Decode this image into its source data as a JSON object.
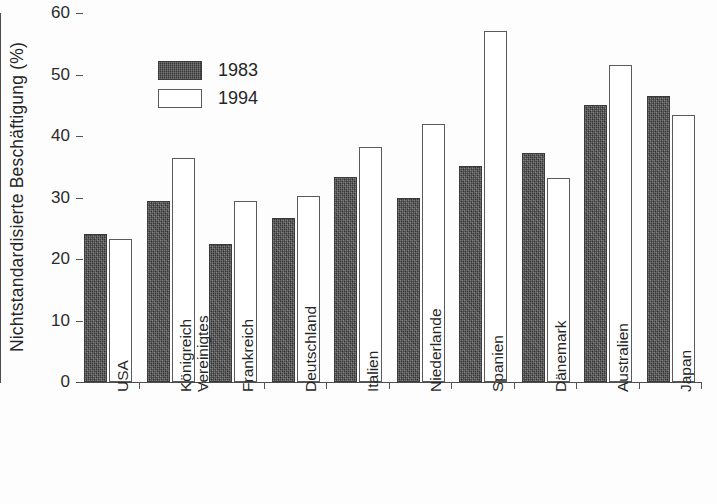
{
  "chart_data": {
    "type": "bar",
    "title": "",
    "xlabel": "",
    "ylabel": "Nichtstandardisierte Beschäftigung (%)",
    "ylim": [
      0,
      60
    ],
    "ytick_labels": [
      "0",
      "10",
      "20",
      "30",
      "40",
      "50",
      "60"
    ],
    "ytick_values": [
      0,
      10,
      20,
      30,
      40,
      50,
      60
    ],
    "grid": false,
    "legend_position": "upper-left-inside",
    "categories": [
      "USA",
      "Vereinigtes Königreich",
      "Frankreich",
      "Deutschland",
      "Italien",
      "Niederlande",
      "Spanien",
      "Dänemark",
      "Australien",
      "Japan"
    ],
    "category_lines": [
      [
        "USA"
      ],
      [
        "Vereinigtes",
        "Königreich"
      ],
      [
        "Frankreich"
      ],
      [
        "Deutschland"
      ],
      [
        "Italien"
      ],
      [
        "Niederlande"
      ],
      [
        "Spanien"
      ],
      [
        "Dänemark"
      ],
      [
        "Australien"
      ],
      [
        "Japan"
      ]
    ],
    "series": [
      {
        "name": "1983",
        "color": "#4a4a4a",
        "values": [
          24.0,
          29.5,
          22.5,
          26.7,
          33.3,
          30.0,
          35.2,
          37.3,
          45.0,
          46.5
        ]
      },
      {
        "name": "1994",
        "color": "#ffffff",
        "values": [
          23.3,
          36.4,
          29.5,
          30.3,
          38.2,
          42.0,
          57.0,
          33.2,
          51.5,
          43.4
        ]
      }
    ]
  },
  "legend": {
    "entries": [
      {
        "label": "1983",
        "swatch": "dark"
      },
      {
        "label": "1994",
        "swatch": "light"
      }
    ]
  },
  "axis": {
    "y_title": "Nichtstandardisierte Beschäftigung (%)"
  }
}
